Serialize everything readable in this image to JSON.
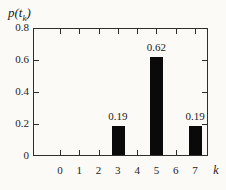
{
  "chart_data": {
    "type": "bar",
    "title": "",
    "ylabel": "p(t_k)",
    "xlabel": "k",
    "categories": [
      "0",
      "1",
      "2",
      "3",
      "4",
      "5",
      "6",
      "7"
    ],
    "values": [
      0,
      0,
      0,
      0.19,
      0,
      0.62,
      0,
      0.19
    ],
    "data_labels": [
      "",
      "",
      "",
      "0.19",
      "",
      "0.62",
      "",
      "0.19"
    ],
    "ylim": [
      0,
      0.8
    ],
    "yticks": [
      0,
      0.2,
      0.4,
      0.6,
      0.8
    ],
    "grid": "off",
    "legend": "none",
    "bar_color": "#0a0a0a",
    "frame": "boxed-with-mirrored-ticks"
  },
  "labels": {
    "ylabel_open": "p(",
    "ylabel_arg": "t",
    "ylabel_sub": "k",
    "ylabel_close": ")",
    "xlabel": "k"
  }
}
